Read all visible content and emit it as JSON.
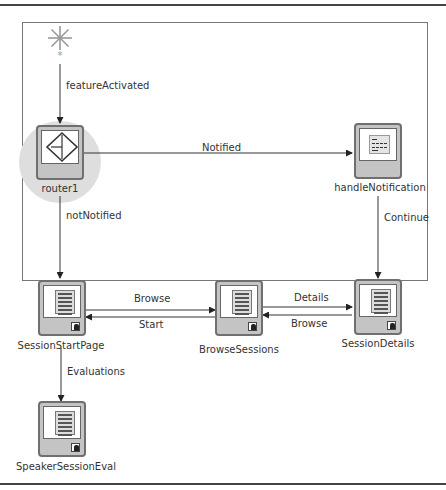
{
  "diagram": {
    "start": {
      "icon": "asterisk-start-icon",
      "label": "*"
    },
    "nodes": [
      {
        "id": "router1",
        "label": "router1",
        "type": "router",
        "icon": "router-diamond-icon"
      },
      {
        "id": "handleNotification",
        "label": "handleNotification",
        "type": "method-call",
        "icon": "method-call-icon"
      },
      {
        "id": "SessionStartPage",
        "label": "SessionStartPage",
        "type": "view",
        "icon": "page-icon"
      },
      {
        "id": "BrowseSessions",
        "label": "BrowseSessions",
        "type": "view",
        "icon": "page-icon"
      },
      {
        "id": "SessionDetails",
        "label": "SessionDetails",
        "type": "view",
        "icon": "page-icon"
      },
      {
        "id": "SpeakerSessionEval",
        "label": "SpeakerSessionEval",
        "type": "view",
        "icon": "page-icon"
      }
    ],
    "edges": [
      {
        "from": "*",
        "to": "router1",
        "label": "featureActivated"
      },
      {
        "from": "router1",
        "to": "handleNotification",
        "label": "Notified"
      },
      {
        "from": "router1",
        "to": "SessionStartPage",
        "label": "notNotified"
      },
      {
        "from": "handleNotification",
        "to": "SessionDetails",
        "label": "Continue"
      },
      {
        "from": "SessionStartPage",
        "to": "BrowseSessions",
        "label": "Browse"
      },
      {
        "from": "BrowseSessions",
        "to": "SessionStartPage",
        "label": "Start"
      },
      {
        "from": "BrowseSessions",
        "to": "SessionDetails",
        "label": "Details"
      },
      {
        "from": "SessionDetails",
        "to": "BrowseSessions",
        "label": "Browse"
      },
      {
        "from": "SessionStartPage",
        "to": "SpeakerSessionEval",
        "label": "Evaluations"
      }
    ]
  }
}
